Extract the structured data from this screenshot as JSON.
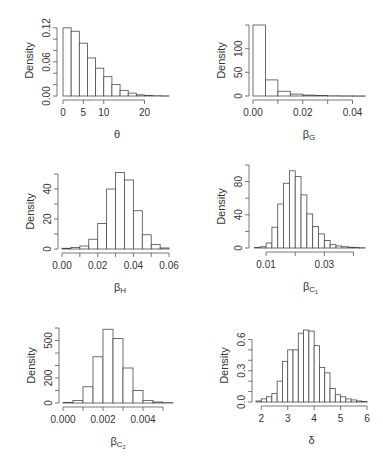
{
  "figure": {
    "width": 383,
    "height": 460,
    "bar_fill": "#ffffff",
    "bar_stroke": "#4a4a4a",
    "axis_color": "#555555",
    "text_color": "#333333"
  },
  "chart_data": [
    {
      "type": "bar",
      "subtype": "histogram",
      "panel": "top-left",
      "title": "",
      "xlabel": "θ",
      "xlabel_sub": "",
      "ylabel": "Density",
      "bin_width": 2,
      "bin_edges": [
        0,
        2,
        4,
        6,
        8,
        10,
        12,
        14,
        16,
        18,
        20,
        22,
        24,
        26
      ],
      "values": [
        0.12,
        0.114,
        0.093,
        0.067,
        0.049,
        0.034,
        0.02,
        0.01,
        0.005,
        0.002,
        0.001,
        0.0005,
        0.0003
      ],
      "xlim": [
        -0.5,
        27
      ],
      "ylim": [
        0,
        0.125
      ],
      "xticks": [
        0,
        5,
        10,
        20
      ],
      "xtick_labels": [
        "0",
        "5",
        "10",
        "20"
      ],
      "yticks": [
        0.0,
        0.02,
        0.04,
        0.06,
        0.08,
        0.1,
        0.12
      ],
      "ytick_labels": [
        "0.00",
        "",
        "",
        "0.06",
        "",
        "",
        "0.12"
      ],
      "grid": false,
      "legend": null,
      "plot_box": {
        "x0": 61,
        "y0": 25,
        "width": 112,
        "height": 71
      }
    },
    {
      "type": "bar",
      "subtype": "histogram",
      "panel": "top-right",
      "title": "",
      "xlabel": "β",
      "xlabel_sub": "G",
      "ylabel": "Density",
      "bin_width": 0.005,
      "bin_edges": [
        0.0,
        0.005,
        0.01,
        0.015,
        0.02,
        0.025,
        0.03,
        0.035,
        0.04,
        0.045
      ],
      "values": [
        150,
        34,
        10,
        4,
        2,
        1,
        0.5,
        0.3,
        0.2
      ],
      "xlim": [
        0.0,
        0.045
      ],
      "ylim": [
        0,
        150
      ],
      "xticks": [
        0.0,
        0.01,
        0.02,
        0.03,
        0.04
      ],
      "xtick_labels": [
        "0.00",
        "",
        "0.02",
        "",
        "0.04"
      ],
      "yticks": [
        0,
        50,
        100,
        150
      ],
      "ytick_labels": [
        "0",
        "50",
        "100",
        ""
      ],
      "grid": false,
      "legend": null,
      "plot_box": {
        "x0": 253,
        "y0": 25,
        "width": 112,
        "height": 71
      }
    },
    {
      "type": "bar",
      "subtype": "histogram",
      "panel": "middle-left",
      "title": "",
      "xlabel": "β",
      "xlabel_sub": "H",
      "ylabel": "Density",
      "bin_width": 0.005,
      "bin_edges": [
        0.0,
        0.005,
        0.01,
        0.015,
        0.02,
        0.025,
        0.03,
        0.035,
        0.04,
        0.045,
        0.05,
        0.055,
        0.06
      ],
      "values": [
        0.5,
        1,
        2,
        6.5,
        17,
        40,
        51,
        46,
        25.5,
        9.5,
        3,
        0.7
      ],
      "xlim": [
        0.0,
        0.065
      ],
      "ylim": [
        0,
        50
      ],
      "xticks": [
        0.0,
        0.01,
        0.02,
        0.03,
        0.04,
        0.05,
        0.06
      ],
      "xtick_labels": [
        "0.00",
        "",
        "0.02",
        "",
        "0.04",
        "",
        "0.06"
      ],
      "yticks": [
        0,
        10,
        20,
        30,
        40,
        50
      ],
      "ytick_labels": [
        "0",
        "",
        "20",
        "",
        "40",
        ""
      ],
      "grid": false,
      "legend": null,
      "plot_box": {
        "x0": 62,
        "y0": 174,
        "width": 116,
        "height": 75
      }
    },
    {
      "type": "bar",
      "subtype": "histogram",
      "panel": "middle-right",
      "title": "",
      "xlabel": "β",
      "xlabel_sub": "C1",
      "ylabel": "Density",
      "bin_width": 0.002,
      "bin_edges": [
        0.006,
        0.008,
        0.01,
        0.012,
        0.014,
        0.016,
        0.018,
        0.02,
        0.022,
        0.024,
        0.026,
        0.028,
        0.03,
        0.032,
        0.034,
        0.036,
        0.038,
        0.04,
        0.042,
        0.044
      ],
      "values": [
        0.5,
        1.5,
        6,
        25,
        53,
        78,
        93,
        86,
        64,
        41,
        26,
        17,
        9,
        4,
        2.5,
        1.5,
        1,
        0.5,
        0.3
      ],
      "xlim": [
        0.0055,
        0.045
      ],
      "ylim": [
        0,
        100
      ],
      "xticks": [
        0.01,
        0.02,
        0.03,
        0.04
      ],
      "xtick_labels": [
        "0.01",
        "",
        "0.03",
        ""
      ],
      "yticks": [
        0,
        20,
        40,
        60,
        80,
        100
      ],
      "ytick_labels": [
        "0",
        "",
        "40",
        "",
        "80",
        ""
      ],
      "grid": false,
      "legend": null,
      "plot_box": {
        "x0": 253,
        "y0": 165,
        "width": 115,
        "height": 83
      }
    },
    {
      "type": "bar",
      "subtype": "histogram",
      "panel": "bottom-left",
      "title": "",
      "xlabel": "β",
      "xlabel_sub": "C2",
      "ylabel": "Density",
      "bin_width": 0.0005,
      "bin_edges": [
        0.0,
        0.0005,
        0.001,
        0.0015,
        0.002,
        0.0025,
        0.003,
        0.0035,
        0.004,
        0.0045,
        0.005,
        0.0055
      ],
      "values": [
        5,
        20,
        130,
        370,
        590,
        515,
        280,
        100,
        20,
        8,
        3
      ],
      "xlim": [
        0.0,
        0.0055
      ],
      "ylim": [
        0,
        600
      ],
      "xticks": [
        0.0,
        0.001,
        0.002,
        0.003,
        0.004,
        0.005
      ],
      "xtick_labels": [
        "0.000",
        "",
        "0.002",
        "",
        "0.004",
        ""
      ],
      "yticks": [
        0,
        100,
        200,
        300,
        400,
        500,
        600
      ],
      "ytick_labels": [
        "0",
        "",
        "200",
        "",
        "",
        "500",
        ""
      ],
      "grid": false,
      "legend": null,
      "plot_box": {
        "x0": 63,
        "y0": 328,
        "width": 110,
        "height": 75
      }
    },
    {
      "type": "bar",
      "subtype": "histogram",
      "panel": "bottom-right",
      "title": "",
      "xlabel": "δ",
      "xlabel_sub": "",
      "ylabel": "Density",
      "bin_width": 0.2,
      "bin_edges": [
        1.8,
        2.0,
        2.2,
        2.4,
        2.6,
        2.8,
        3.0,
        3.2,
        3.4,
        3.6,
        3.8,
        4.0,
        4.2,
        4.4,
        4.6,
        4.8,
        5.0,
        5.2,
        5.4,
        5.6,
        5.8,
        6.0
      ],
      "values": [
        0.01,
        0.03,
        0.05,
        0.08,
        0.2,
        0.39,
        0.5,
        0.5,
        0.66,
        0.69,
        0.68,
        0.54,
        0.33,
        0.28,
        0.13,
        0.07,
        0.05,
        0.03,
        0.02,
        0.01,
        0.005
      ],
      "xlim": [
        1.8,
        6.0
      ],
      "ylim": [
        0,
        0.7
      ],
      "xticks": [
        2,
        3,
        4,
        5,
        6
      ],
      "xtick_labels": [
        "2",
        "3",
        "4",
        "5",
        "6"
      ],
      "yticks": [
        0.0,
        0.1,
        0.2,
        0.3,
        0.4,
        0.5,
        0.6
      ],
      "ytick_labels": [
        "0.0",
        "",
        "",
        "0.3",
        "",
        "",
        "0.6"
      ],
      "grid": false,
      "legend": null,
      "plot_box": {
        "x0": 256,
        "y0": 329,
        "width": 111,
        "height": 73
      }
    }
  ]
}
